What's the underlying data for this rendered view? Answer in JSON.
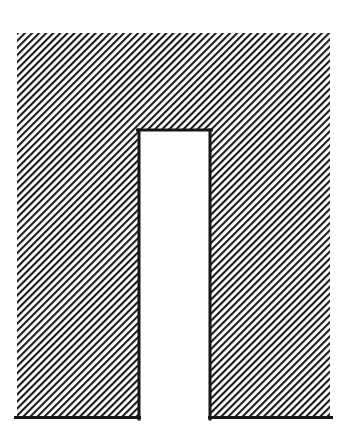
{
  "document": {
    "title": "Hatched Cross-Section Figure",
    "background_color": "#ffffff"
  },
  "figure": {
    "name": "hatched-channel-section",
    "hatch": {
      "angle_degrees": 45,
      "direction": "lower-left-to-upper-right",
      "period_px": 5,
      "line_width_px": 2.1,
      "line_color": "#1a1a1a",
      "gap_color": "#ffffff"
    },
    "outline": {
      "color": "#161616",
      "width_px": 3,
      "edges_with_border": [
        "bottom-left-leg",
        "bottom-right-leg",
        "notch-left",
        "notch-top",
        "notch-right"
      ],
      "edges_without_border": [
        "outer-top",
        "outer-left",
        "outer-right"
      ]
    },
    "geometry": {
      "units": "px",
      "outer": {
        "left": 17,
        "top": 33,
        "right": 330,
        "bottom": 419,
        "width": 313,
        "height": 386
      },
      "notch": {
        "left": 138,
        "top": 129,
        "right": 211,
        "bottom": 419,
        "width": 73,
        "height": 290,
        "open_at": "bottom",
        "fill_color": "#ffffff"
      },
      "left_leg": {
        "left": 17,
        "right": 138,
        "width": 121
      },
      "right_leg": {
        "left": 211,
        "right": 330,
        "width": 119
      },
      "top_flange": {
        "top": 33,
        "bottom": 129,
        "height": 96
      },
      "polygon_points": "17,33 330,33 330,419 211,419 211,129 138,129 138,419 17,419"
    }
  }
}
